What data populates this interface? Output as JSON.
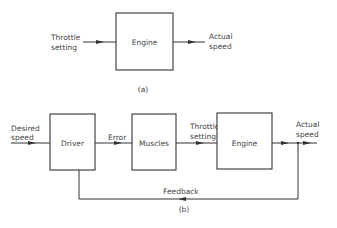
{
  "diagram_a": {
    "caption": "(a)",
    "input_label_line1": "Throttle",
    "input_label_line2": "setting",
    "block_label": "Engine",
    "output_label_line1": "Actual",
    "output_label_line2": "speed"
  },
  "diagram_b": {
    "caption": "(b)",
    "input_label_line1": "Desired",
    "input_label_line2": "speed",
    "blocks": [
      {
        "label": "Driver"
      },
      {
        "label": "Muscles"
      },
      {
        "label": "Engine"
      }
    ],
    "signal_error": "Error",
    "signal_throttle_line1": "Throttle",
    "signal_throttle_line2": "setting",
    "output_label_line1": "Actual",
    "output_label_line2": "speed",
    "feedback_label": "Feedback"
  }
}
